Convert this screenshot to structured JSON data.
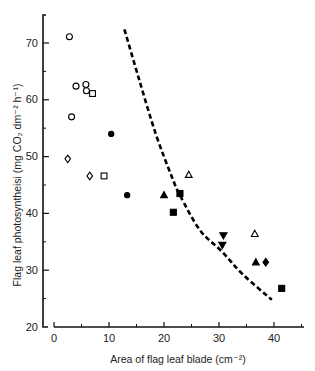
{
  "chart_data": {
    "type": "scatter",
    "title": "",
    "xlabel": "Area of flag leaf blade (cm⁻²)",
    "ylabel": "Flag leaf photosyntheisi (mg CO₂ dm⁻² h⁻¹)",
    "xlim": [
      0,
      45
    ],
    "ylim": [
      20,
      75
    ],
    "x_ticks": [
      0,
      10,
      20,
      30,
      40
    ],
    "x_minor_ticks": [
      5,
      15,
      25,
      35,
      45
    ],
    "y_ticks": [
      20,
      30,
      40,
      50,
      60,
      70
    ],
    "y_minor_ticks": [
      25,
      35,
      45,
      55,
      65
    ],
    "grid": false,
    "legend": null,
    "series": [
      {
        "name": "open-circle",
        "marker": "circle",
        "filled": false,
        "points": [
          [
            2.8,
            71.1
          ],
          [
            4.0,
            62.4
          ],
          [
            5.8,
            62.7
          ],
          [
            5.9,
            61.6
          ],
          [
            3.2,
            57.0
          ]
        ]
      },
      {
        "name": "open-square",
        "marker": "square",
        "filled": false,
        "points": [
          [
            7.0,
            61.1
          ],
          [
            9.1,
            46.6
          ]
        ]
      },
      {
        "name": "open-diamond",
        "marker": "diamond",
        "filled": false,
        "points": [
          [
            2.5,
            49.6
          ],
          [
            6.5,
            46.6
          ]
        ]
      },
      {
        "name": "filled-circle",
        "marker": "circle",
        "filled": true,
        "points": [
          [
            10.4,
            54.0
          ],
          [
            13.3,
            43.2
          ]
        ]
      },
      {
        "name": "open-triangle",
        "marker": "triangle",
        "filled": false,
        "points": [
          [
            24.5,
            46.8
          ],
          [
            36.5,
            36.4
          ]
        ]
      },
      {
        "name": "filled-triangle",
        "marker": "triangle",
        "filled": true,
        "points": [
          [
            20.0,
            43.2
          ],
          [
            36.7,
            31.4
          ]
        ]
      },
      {
        "name": "filled-square",
        "marker": "square",
        "filled": true,
        "points": [
          [
            22.9,
            43.5
          ],
          [
            21.7,
            40.2
          ],
          [
            41.4,
            26.8
          ]
        ]
      },
      {
        "name": "filled-inverted-triangle",
        "marker": "triangle-down",
        "filled": true,
        "points": [
          [
            30.8,
            36.1
          ],
          [
            30.6,
            34.4
          ]
        ]
      },
      {
        "name": "filled-diamond",
        "marker": "diamond",
        "filled": true,
        "points": [
          [
            38.5,
            31.4
          ]
        ]
      }
    ],
    "curve": {
      "name": "fitted-curve",
      "style": "dashed",
      "points": [
        [
          12.8,
          72.4
        ],
        [
          15.5,
          63.5
        ],
        [
          18.5,
          54.0
        ],
        [
          21.4,
          46.5
        ],
        [
          22.9,
          43.2
        ],
        [
          26.5,
          37.1
        ],
        [
          30.5,
          33.3
        ],
        [
          34.4,
          29.2
        ],
        [
          39.6,
          24.8
        ]
      ]
    }
  },
  "axes": {
    "x_tick_labels": [
      "0",
      "10",
      "20",
      "30",
      "40"
    ],
    "y_tick_labels": [
      "20",
      "30",
      "40",
      "50",
      "60",
      "70"
    ],
    "x_title": "Area of flag leaf blade (cm⁻²)",
    "y_title": "Flag leaf photosyntheisi (mg CO₂ dm⁻² h⁻¹)"
  }
}
